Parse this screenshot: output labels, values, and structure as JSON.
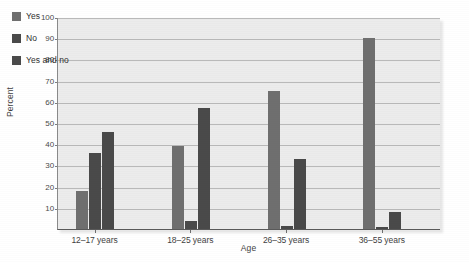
{
  "chart_data": {
    "type": "bar",
    "title": "",
    "subtitle": "",
    "xlabel": "Age",
    "ylabel": "Percent",
    "categories": [
      "12–17 years",
      "18–25 years",
      "26–35 years",
      "36–55 years"
    ],
    "series": [
      {
        "name": "Yes",
        "color": "#6f6f6f",
        "values": [
          18,
          39,
          65,
          90
        ]
      },
      {
        "name": "No",
        "color": "#4a4a4a",
        "values": [
          36,
          4,
          1.5,
          1
        ]
      },
      {
        "name": "Yes and no",
        "color": "#4a4a4a",
        "values": [
          46,
          57,
          33,
          8
        ]
      }
    ],
    "ylim": [
      0,
      100
    ],
    "ytick_values": [
      10,
      20,
      30,
      40,
      50,
      60,
      70,
      80,
      90,
      100
    ],
    "ytick_labels": [
      "10",
      "20",
      "30",
      "40",
      "50",
      "60",
      "70",
      "80",
      "90",
      "100"
    ],
    "grid": true,
    "legend_position": "top-left",
    "plot_background": "#ececec",
    "gridline_color": "#b9b9b9",
    "axis_color": "#5a5a5a"
  },
  "legend": {
    "items": [
      {
        "label": "Yes",
        "swatch": "#6f6f6f"
      },
      {
        "label": "No",
        "swatch": "#4a4a4a"
      },
      {
        "label": "Yes and no",
        "swatch": "#4a4a4a"
      }
    ]
  },
  "axes": {
    "y_title": "Percent",
    "x_title": "Age"
  }
}
